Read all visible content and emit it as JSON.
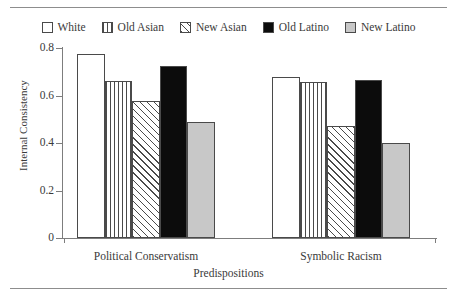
{
  "chart_data": {
    "type": "bar",
    "title": "",
    "subtitle": "",
    "xlabel": "Predispositions",
    "ylabel": "Internal Consistency",
    "categories": [
      "Political Conservatism",
      "Symbolic Racism"
    ],
    "series": [
      {
        "name": "White",
        "values": [
          0.775,
          0.68
        ],
        "fill": "white-outline"
      },
      {
        "name": "Old Asian",
        "values": [
          0.66,
          0.655
        ],
        "fill": "vertical-stripes"
      },
      {
        "name": "New Asian",
        "values": [
          0.575,
          0.47
        ],
        "fill": "diagonal-hatch"
      },
      {
        "name": "Old Latino",
        "values": [
          0.725,
          0.665
        ],
        "fill": "solid-black"
      },
      {
        "name": "New Latino",
        "values": [
          0.49,
          0.4
        ],
        "fill": "light-gray"
      }
    ],
    "ylim": [
      0,
      0.8
    ],
    "yticks": [
      "0",
      "0.2",
      "0.4",
      "0.6",
      "0.8"
    ],
    "ytick_values": [
      0,
      0.2,
      0.4,
      0.6,
      0.8
    ],
    "grid": false,
    "legend_position": "top",
    "legend": [
      "White",
      "Old Asian",
      "New Asian",
      "Old Latino",
      "New Latino"
    ],
    "colors": {
      "outline": "#4a4a4a",
      "axis": "#7d7d7d",
      "black_bar": "#0c0c0c",
      "gray_bar": "#c8c8c8",
      "text": "#3a3a3a",
      "rule": "#8d8d8d"
    }
  }
}
